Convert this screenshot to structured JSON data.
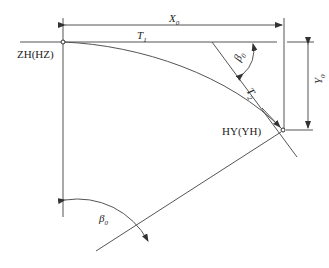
{
  "labels": {
    "start_point": "ZH(HZ)",
    "end_point": "HY(YH)",
    "x0": "X",
    "x0_sub": "0",
    "y0": "Y",
    "y0_sub": "0",
    "t1": "T",
    "t1_sub": "1",
    "t2": "T",
    "t2_sub": "2",
    "beta_top": "β",
    "beta_top_sub": "0",
    "beta_bottom": "β",
    "beta_bottom_sub": "0"
  }
}
